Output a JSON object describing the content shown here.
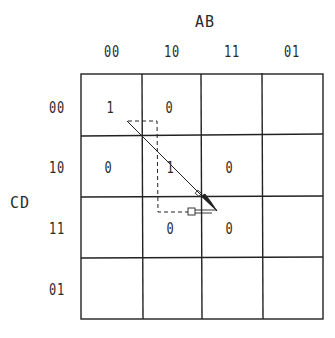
{
  "kmap": {
    "col_variable": "AB",
    "row_variable": "CD",
    "col_labels": [
      "00",
      "10",
      "11",
      "01"
    ],
    "row_labels": [
      "00",
      "10",
      "11",
      "01"
    ],
    "cells": [
      [
        "1",
        "0",
        "",
        ""
      ],
      [
        "0",
        "1",
        "0",
        ""
      ],
      [
        "",
        "0",
        "0",
        ""
      ],
      [
        "",
        "",
        "",
        ""
      ]
    ]
  },
  "colors": {
    "line": "#222222",
    "background": "#ffffff"
  },
  "annotations": {
    "arrow": "diagonal arrow from cell CD=00/AB=00 toward CD=11/AB=11",
    "dashed_path": "dashed L-shaped path from cell CD=00/AB=00 down column AB=10 to CD=11"
  }
}
